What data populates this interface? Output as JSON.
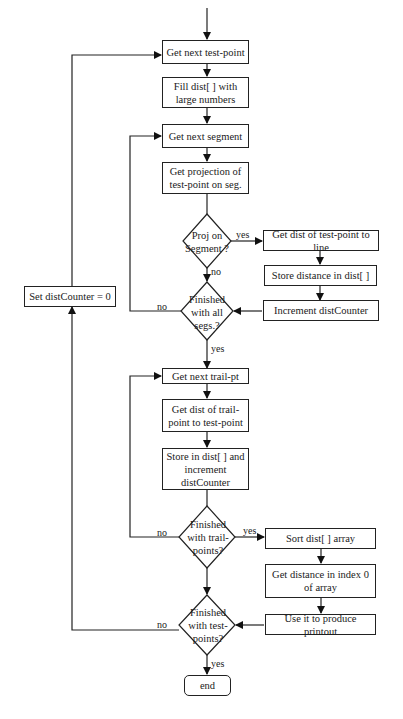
{
  "flowchart": {
    "processes": {
      "get_next_test_point": "Get next test-point",
      "fill_dist": "Fill dist[ ] with large numbers",
      "get_next_segment": "Get next segment",
      "get_projection": "Get projection of test-point on seg.",
      "get_dist_to_line": "Get dist of test-point to line",
      "store_distance": "Store distance in dist[ ]",
      "increment_counter": "Increment distCounter",
      "set_dist_counter": "Set distCounter = 0",
      "get_next_trail_pt": "Get next trail-pt",
      "get_dist_trail": "Get dist of trail-point to test-point",
      "store_and_increment": "Store in dist[ ] and increment distCounter",
      "sort_dist": "Sort dist[ ] array",
      "get_distance_index0": "Get distance in index 0 of array",
      "produce_printout": "Use it to produce printout",
      "end": "end"
    },
    "decisions": {
      "proj_on_segment": "Proj on Segment ?",
      "finished_segs": "Finished with all segs.?",
      "finished_trail": "Finished with trail-points?",
      "finished_test": "Finished with test-points?"
    },
    "labels": {
      "proj_yes": "yes",
      "proj_no": "no",
      "segs_no": "no",
      "segs_yes": "yes",
      "trail_no": "no",
      "trail_yes": "yes",
      "test_no": "no",
      "test_yes": "yes"
    }
  }
}
